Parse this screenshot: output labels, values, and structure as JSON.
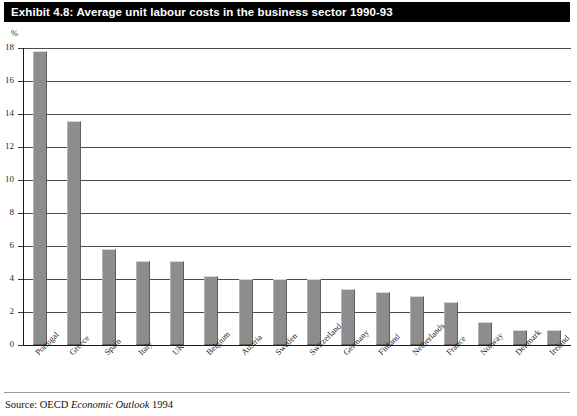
{
  "title": "Exhibit 4.8: Average unit labour costs in the business sector 1990-93",
  "axis_unit": "%",
  "source": {
    "prefix": "Source: OECD ",
    "italic": "Economic Outlook",
    "suffix": " 1994"
  },
  "colors": {
    "title_bar_background": "#000000",
    "title_bar_text": "#ffffff",
    "bar_fill": "#8d8d8d",
    "bar_border": "#5f5f5f",
    "gridline": "#4a4a4a",
    "axis": "#1a1a1a",
    "page_background": "#ffffff"
  },
  "chart_data": {
    "type": "bar",
    "title": "Exhibit 4.8: Average unit labour costs in the business sector 1990-93",
    "xlabel": "",
    "ylabel": "%",
    "ylim": [
      0,
      18
    ],
    "ytick_step": 2,
    "yticks": [
      0,
      2,
      4,
      6,
      8,
      10,
      12,
      14,
      16,
      18
    ],
    "ytick_labels": [
      "0",
      "2",
      "4",
      "6",
      "8",
      "10",
      "12",
      "14",
      "16",
      "18"
    ],
    "grid": true,
    "legend": false,
    "categories": [
      "Portugal",
      "Greece",
      "Spain",
      "Italy",
      "UK",
      "Belgium",
      "Austria",
      "Sweden",
      "Switzerland",
      "Germany",
      "Finland",
      "Netherlands",
      "France",
      "Norway",
      "Denmark",
      "Ireland"
    ],
    "values": [
      17.8,
      13.6,
      5.8,
      5.1,
      5.1,
      4.2,
      4.0,
      4.0,
      4.0,
      3.4,
      3.2,
      3.0,
      2.6,
      1.4,
      0.9,
      0.9
    ]
  }
}
